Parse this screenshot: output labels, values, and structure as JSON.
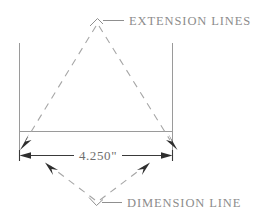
{
  "drawing": {
    "title": "dimension-line-and-extension-lines-callout",
    "background_color": "#ffffff",
    "line_color": "#8f8f8f",
    "dashed_color": "#a6a6a6",
    "arrow_color": "#2e2e2e",
    "text_color": "#8c8c8c",
    "dimension_text_color": "#6e6e6e"
  },
  "labels": {
    "extension_lines": "EXTENSION  LINES",
    "dimension_line": "DIMENSION  LINE"
  },
  "dimension": {
    "value": "4.250\"",
    "numeric_value": 4.25,
    "unit": "inch"
  },
  "annotations": {
    "extension_leader_name": "extension-lines-leader",
    "dimension_leader_name": "dimension-line-leader"
  }
}
